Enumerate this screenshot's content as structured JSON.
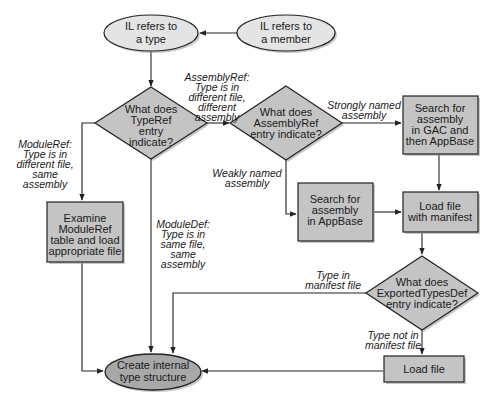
{
  "nodes": {
    "il_type": {
      "lines": [
        "IL refers to",
        "a type"
      ],
      "shape": "ellipse"
    },
    "il_member": {
      "lines": [
        "IL refers to",
        "a member"
      ],
      "shape": "ellipse"
    },
    "typeref_decision": {
      "lines": [
        "What does",
        "TypeRef",
        "entry",
        "indicate?"
      ],
      "shape": "diamond"
    },
    "assemblyref_decision": {
      "lines": [
        "What does",
        "AssemblyRef",
        "entry indicate?"
      ],
      "shape": "diamond"
    },
    "search_gac": {
      "lines": [
        "Search for",
        "assembly",
        "in GAC and",
        "then AppBase"
      ],
      "shape": "box"
    },
    "search_appbase": {
      "lines": [
        "Search for",
        "assembly",
        "in AppBase"
      ],
      "shape": "box"
    },
    "load_manifest": {
      "lines": [
        "Load file",
        "with manifest"
      ],
      "shape": "box"
    },
    "exportedtypes_decision": {
      "lines": [
        "What does",
        "ExportedTypesDef",
        "entry indicate?"
      ],
      "shape": "diamond"
    },
    "load_file": {
      "lines": [
        "Load file"
      ],
      "shape": "box"
    },
    "examine_moduleref": {
      "lines": [
        "Examine",
        "ModuleRef",
        "table and load",
        "appropriate file"
      ],
      "shape": "box"
    },
    "create_type": {
      "lines": [
        "Create internal",
        "type structure"
      ],
      "shape": "ellipse"
    }
  },
  "edge_labels": {
    "assemblyref": [
      "AssemblyRef:",
      "Type is in",
      "different file,",
      "different",
      "assembly"
    ],
    "moduleref": [
      "ModuleRef:",
      "Type is in",
      "different file,",
      "same",
      "assembly"
    ],
    "moduledef": [
      "ModuleDef:",
      "Type is in",
      "same file,",
      "same",
      "assembly"
    ],
    "strongly_named": [
      "Strongly named",
      "assembly"
    ],
    "weakly_named": [
      "Weakly named",
      "assembly"
    ],
    "type_in_manifest": [
      "Type in",
      "manifest file"
    ],
    "type_not_in_manifest": [
      "Type not in",
      "manifest file"
    ]
  },
  "colors": {
    "ellipse_fill": "#e4e4e4",
    "shape_fill": "#c4c4c4",
    "terminal_fill": "#a8a8a8",
    "stroke": "#222222"
  }
}
